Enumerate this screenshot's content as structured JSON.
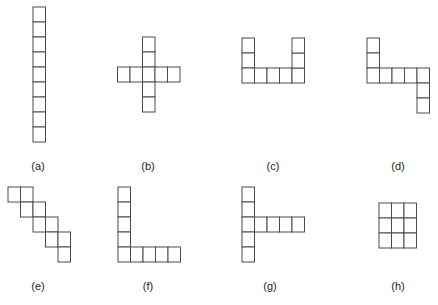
{
  "diagram": {
    "cell_width": 12.5,
    "cell_height": 15,
    "stroke_color": "#4a4a4a",
    "figures": [
      {
        "id": "a",
        "label": "(a)",
        "label_x": 38,
        "label_y": 160,
        "origin": [
          33,
          7
        ],
        "cells": [
          [
            0,
            0
          ],
          [
            0,
            1
          ],
          [
            0,
            2
          ],
          [
            0,
            3
          ],
          [
            0,
            4
          ],
          [
            0,
            5
          ],
          [
            0,
            6
          ],
          [
            0,
            7
          ],
          [
            0,
            8
          ]
        ]
      },
      {
        "id": "b",
        "label": "(b)",
        "label_x": 148,
        "label_y": 160,
        "origin": [
          117.5,
          37
        ],
        "cells": [
          [
            2,
            0
          ],
          [
            2,
            1
          ],
          [
            0,
            2
          ],
          [
            1,
            2
          ],
          [
            2,
            2
          ],
          [
            3,
            2
          ],
          [
            4,
            2
          ],
          [
            2,
            3
          ],
          [
            2,
            4
          ]
        ]
      },
      {
        "id": "c",
        "label": "(c)",
        "label_x": 273,
        "label_y": 160,
        "origin": [
          242,
          38
        ],
        "cells": [
          [
            0,
            0
          ],
          [
            0,
            1
          ],
          [
            0,
            2
          ],
          [
            1,
            2
          ],
          [
            2,
            2
          ],
          [
            3,
            2
          ],
          [
            4,
            2
          ],
          [
            4,
            1
          ],
          [
            4,
            0
          ]
        ]
      },
      {
        "id": "d",
        "label": "(d)",
        "label_x": 398,
        "label_y": 160,
        "origin": [
          367,
          38
        ],
        "cells": [
          [
            0,
            0
          ],
          [
            0,
            1
          ],
          [
            0,
            2
          ],
          [
            1,
            2
          ],
          [
            2,
            2
          ],
          [
            3,
            2
          ],
          [
            4,
            2
          ],
          [
            4,
            3
          ],
          [
            4,
            4
          ]
        ]
      },
      {
        "id": "e",
        "label": "(e)",
        "label_x": 38,
        "label_y": 280,
        "origin": [
          8,
          187
        ],
        "cells": [
          [
            0,
            0
          ],
          [
            1,
            0
          ],
          [
            1,
            1
          ],
          [
            2,
            1
          ],
          [
            2,
            2
          ],
          [
            3,
            2
          ],
          [
            3,
            3
          ],
          [
            4,
            3
          ],
          [
            4,
            4
          ]
        ]
      },
      {
        "id": "f",
        "label": "(f)",
        "label_x": 148,
        "label_y": 280,
        "origin": [
          118,
          187
        ],
        "cells": [
          [
            0,
            0
          ],
          [
            0,
            1
          ],
          [
            0,
            2
          ],
          [
            0,
            3
          ],
          [
            0,
            4
          ],
          [
            1,
            4
          ],
          [
            2,
            4
          ],
          [
            3,
            4
          ],
          [
            4,
            4
          ]
        ]
      },
      {
        "id": "g",
        "label": "(g)",
        "label_x": 270,
        "label_y": 280,
        "origin": [
          242,
          187
        ],
        "cells": [
          [
            0,
            0
          ],
          [
            0,
            1
          ],
          [
            0,
            2
          ],
          [
            0,
            3
          ],
          [
            0,
            4
          ],
          [
            1,
            2
          ],
          [
            2,
            2
          ],
          [
            3,
            2
          ],
          [
            4,
            2
          ]
        ]
      },
      {
        "id": "h",
        "label": "(h)",
        "label_x": 398,
        "label_y": 280,
        "origin": [
          379,
          203
        ],
        "cells": [
          [
            0,
            0
          ],
          [
            1,
            0
          ],
          [
            2,
            0
          ],
          [
            0,
            1
          ],
          [
            1,
            1
          ],
          [
            2,
            1
          ],
          [
            0,
            2
          ],
          [
            1,
            2
          ],
          [
            2,
            2
          ]
        ]
      }
    ]
  }
}
